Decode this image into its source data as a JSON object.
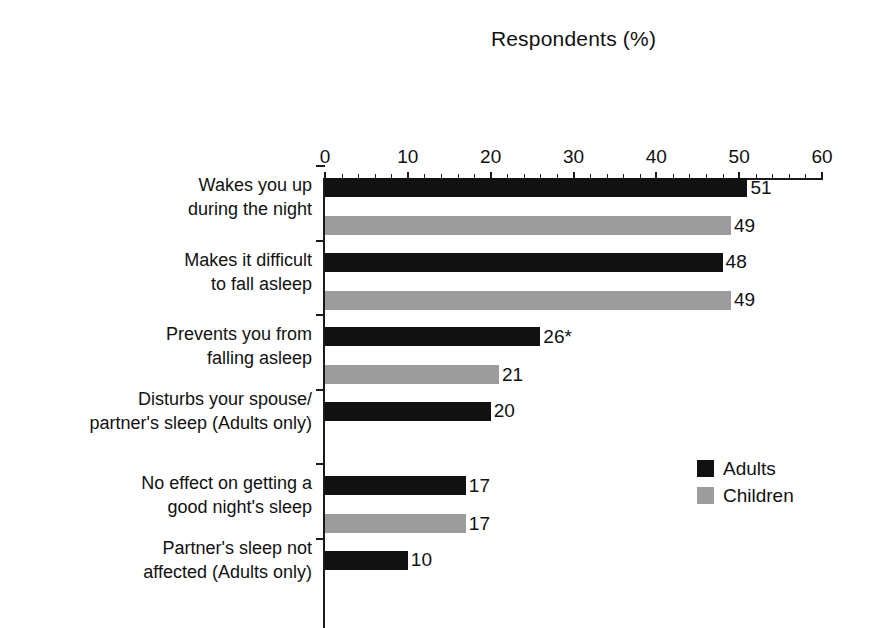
{
  "chart_data": {
    "type": "bar",
    "orientation": "horizontal",
    "title": "Respondents (%)",
    "xlabel": "Respondents (%)",
    "ylabel": "",
    "xlim": [
      0,
      60
    ],
    "xticks": [
      0,
      10,
      20,
      30,
      40,
      50,
      60
    ],
    "xtick_labels": [
      "0",
      "10",
      "20",
      "30",
      "40",
      "50",
      "60"
    ],
    "grid": false,
    "legend_position": "bottom-right",
    "categories": [
      "Wakes you up during the night",
      "Makes it difficult to fall asleep",
      "Prevents you from falling asleep",
      "Disturbs your spouse/ partner's sleep (Adults only)",
      "No effect on getting a good night's sleep",
      "Partner's sleep not affected (Adults only)"
    ],
    "category_lines": [
      [
        "Wakes you up",
        "during the night"
      ],
      [
        "Makes it difficult",
        "to fall asleep"
      ],
      [
        "Prevents you from",
        "falling asleep"
      ],
      [
        "Disturbs your spouse/",
        "partner's sleep (Adults only)"
      ],
      [
        "No effect on getting a",
        "good night's sleep"
      ],
      [
        "Partner's sleep not",
        "affected (Adults only)"
      ]
    ],
    "series": [
      {
        "name": "Adults",
        "color": "#111111",
        "values": [
          51,
          48,
          26,
          20,
          17,
          10
        ],
        "labels": [
          "51",
          "48",
          "26*",
          "20",
          "17",
          "10"
        ]
      },
      {
        "name": "Children",
        "color": "#9c9c9c",
        "values": [
          49,
          49,
          21,
          null,
          17,
          null
        ],
        "labels": [
          "49",
          "49",
          "21",
          "",
          "17",
          ""
        ]
      }
    ],
    "annotations": [
      "* denotes significance marker on Adults value 26"
    ]
  },
  "legend": {
    "items": [
      {
        "label": "Adults",
        "color": "#111111",
        "swatch": "legend-swatch-adults"
      },
      {
        "label": "Children",
        "color": "#9c9c9c",
        "swatch": "legend-swatch-children"
      }
    ]
  }
}
